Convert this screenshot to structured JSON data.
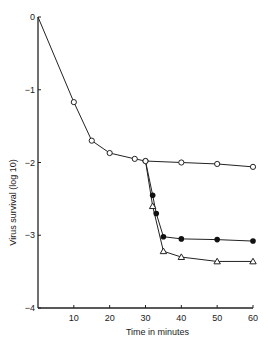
{
  "chart_data": {
    "type": "line",
    "title": "",
    "xlabel": "Time in minutes",
    "ylabel": "Virus survival (log 10)",
    "xlim": [
      0,
      60
    ],
    "ylim": [
      -4,
      0
    ],
    "xticks": [
      10,
      20,
      30,
      40,
      50,
      60
    ],
    "yticks": [
      0,
      -1,
      -2,
      -3,
      -4
    ],
    "ytick_labels": [
      "0",
      "−1",
      "−2",
      "−3",
      "−4"
    ],
    "grid": false,
    "legend": null,
    "series": [
      {
        "name": "open circles",
        "marker": "circle-open",
        "x": [
          0,
          10,
          15,
          20,
          27,
          30,
          40,
          50,
          60
        ],
        "y": [
          0,
          -1.17,
          -1.7,
          -1.87,
          -1.95,
          -1.98,
          -2.0,
          -2.02,
          -2.06
        ]
      },
      {
        "name": "filled circles",
        "marker": "circle-filled",
        "x": [
          30,
          32,
          33,
          35,
          40,
          50,
          60
        ],
        "y": [
          -1.98,
          -2.45,
          -2.7,
          -3.02,
          -3.05,
          -3.06,
          -3.08
        ]
      },
      {
        "name": "open triangles",
        "marker": "triangle-open",
        "x": [
          30,
          32,
          35,
          40,
          50,
          60
        ],
        "y": [
          -1.98,
          -2.6,
          -3.22,
          -3.3,
          -3.36,
          -3.36
        ]
      }
    ]
  }
}
